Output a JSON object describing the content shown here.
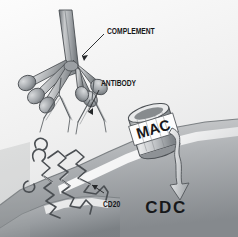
{
  "figure": {
    "width": 238,
    "height": 237,
    "style": "grayscale airbrush scientific illustration",
    "background_color": "#f4f4f4"
  },
  "labels": {
    "complement": "COMPLEMENT",
    "antibody": "ANTIBODY",
    "mac": "MAC",
    "cd20": "CD20",
    "cdc": "CDC"
  },
  "colors": {
    "ink": "#17181a",
    "outline": "#3c3f42",
    "paper_light": "#fbfbfb",
    "paper_mid": "#e6e6e6",
    "cell_top": "#cfcfcf",
    "cell_bottom": "#8d9094",
    "cell_deep": "#6f7478",
    "highlight": "#ffffff",
    "protein_light": "#d6d8da",
    "protein_mid": "#a7abae",
    "protein_dark": "#767b80"
  },
  "elements": {
    "complement_name": "C1q complement protein",
    "complement_arms": 6,
    "antibody_name": "IgG antibody",
    "antibody_count": 2,
    "mac_name": "membrane attack complex pore",
    "cd20_name": "CD20 transmembrane antigen",
    "arrow_name": "cytotoxicity arrow"
  }
}
